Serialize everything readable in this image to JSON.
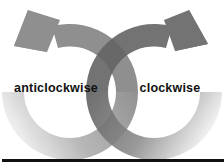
{
  "diagram": {
    "title": "",
    "arrows": [
      {
        "id": "anticlockwise",
        "label": "anticlockwise",
        "direction": "anticlockwise",
        "color": "#8a8a8a",
        "fade_color": "#e6e6e6"
      },
      {
        "id": "clockwise",
        "label": "clockwise",
        "direction": "clockwise",
        "color": "#646464",
        "fade_color": "#eeeeee"
      }
    ],
    "baseline_color": "#111111"
  }
}
